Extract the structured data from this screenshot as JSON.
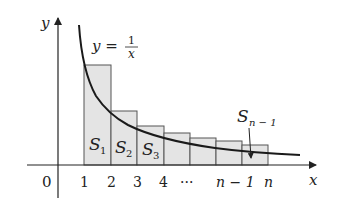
{
  "diagram": {
    "colors": {
      "background": "#ffffff",
      "axis": "#222222",
      "curve": "#1a1a1a",
      "rect_fill": "#e4e4e4",
      "rect_stroke": "#555555"
    },
    "axes": {
      "x_label": "x",
      "y_label": "y",
      "origin_label": "0"
    },
    "curve": {
      "label_lhs": "y =",
      "label_num": "1",
      "label_den": "x"
    },
    "x_ticks": [
      "1",
      "2",
      "3",
      "4",
      "···",
      "n − 1",
      "n"
    ],
    "rect_labels": [
      {
        "base": "S",
        "sub": "1"
      },
      {
        "base": "S",
        "sub": "2"
      },
      {
        "base": "S",
        "sub": "3"
      }
    ],
    "callout": {
      "base": "S",
      "sub": "n − 1"
    }
  }
}
